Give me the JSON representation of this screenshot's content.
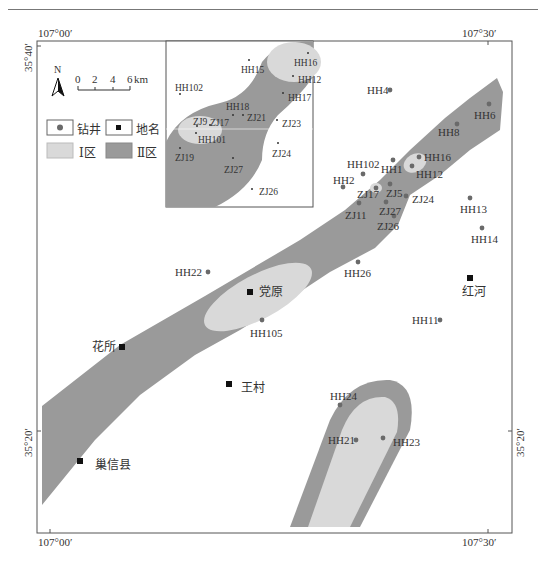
{
  "header": {
    "running_title": ""
  },
  "frame": {
    "top_left_lon": "107°00′",
    "top_right_lon": "107°30′",
    "bottom_left_lon": "107°00′",
    "bottom_right_lon": "107°30′",
    "left_top_lat": "35°40′",
    "left_bottom_lat": "35°20′",
    "right_bottom_lat": "35°20′"
  },
  "north_arrow": {
    "label": "N"
  },
  "scale_bar": {
    "ticks": [
      "0",
      "2",
      "4",
      "6"
    ],
    "unit": "km"
  },
  "legend": {
    "well": "钻井",
    "place": "地名",
    "zone1": "Ⅰ区",
    "zone2": "Ⅱ区"
  },
  "colors": {
    "zone1_fill": "#d9d9d9",
    "zone2_fill": "#9a9a9a",
    "well_dot": "#6a6a6a",
    "place_marker": "#111111"
  },
  "wells": [
    {
      "id": "HH4",
      "x": 390,
      "y": 90
    },
    {
      "id": "HH6",
      "x": 489,
      "y": 104
    },
    {
      "id": "HH8",
      "x": 457,
      "y": 124
    },
    {
      "id": "HH16",
      "x": 419,
      "y": 157
    },
    {
      "id": "HH102",
      "x": 363,
      "y": 174
    },
    {
      "id": "HH1",
      "x": 393,
      "y": 160
    },
    {
      "id": "HH12",
      "x": 412,
      "y": 166
    },
    {
      "id": "HH2",
      "x": 343,
      "y": 187
    },
    {
      "id": "ZJ17",
      "x": 376,
      "y": 188
    },
    {
      "id": "ZJ5",
      "x": 390,
      "y": 184
    },
    {
      "id": "ZJ24",
      "x": 406,
      "y": 196
    },
    {
      "id": "ZJ11",
      "x": 359,
      "y": 203
    },
    {
      "id": "ZJ27",
      "x": 386,
      "y": 202
    },
    {
      "id": "ZJ26",
      "x": 394,
      "y": 216
    },
    {
      "id": "HH13",
      "x": 470,
      "y": 198
    },
    {
      "id": "HH14",
      "x": 482,
      "y": 228
    },
    {
      "id": "HH22",
      "x": 208,
      "y": 272
    },
    {
      "id": "HH26",
      "x": 358,
      "y": 262
    },
    {
      "id": "HH105",
      "x": 262,
      "y": 320
    },
    {
      "id": "HH11",
      "x": 440,
      "y": 320
    },
    {
      "id": "HH24",
      "x": 340,
      "y": 405
    },
    {
      "id": "HH21",
      "x": 356,
      "y": 440
    },
    {
      "id": "HH23",
      "x": 383,
      "y": 438
    }
  ],
  "places": [
    {
      "name": "党原",
      "x": 250,
      "y": 292
    },
    {
      "name": "红河",
      "x": 470,
      "y": 278
    },
    {
      "name": "花所",
      "x": 122,
      "y": 347
    },
    {
      "name": "王村",
      "x": 229,
      "y": 384
    },
    {
      "name": "巢信县",
      "x": 80,
      "y": 461
    }
  ],
  "inset": {
    "wells": [
      "HH102",
      "HH15",
      "HH16",
      "HH12",
      "HH17",
      "HH18",
      "ZJ21",
      "ZJ23",
      "ZJ9",
      "ZJ17",
      "HH101",
      "ZJ19",
      "ZJ24",
      "ZJ27",
      "ZJ26"
    ]
  }
}
